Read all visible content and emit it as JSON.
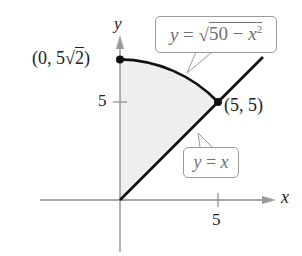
{
  "diagram": {
    "axes": {
      "x_label": "x",
      "y_label": "y",
      "x_ticks": [
        {
          "value": 5,
          "label": "5"
        }
      ],
      "y_ticks": [
        {
          "value": 5,
          "label": "5"
        }
      ]
    },
    "curves": [
      {
        "name": "circle-arc",
        "equation": "y = √(50 − x²)",
        "from": [
          0,
          7.071
        ],
        "to": [
          5,
          5
        ]
      },
      {
        "name": "line",
        "equation": "y = x",
        "from": [
          0,
          0
        ],
        "to": [
          7.2,
          7.2
        ]
      }
    ],
    "region": {
      "description": "shaded region between y = x and y = √(50 − x²) for 0 ≤ x ≤ 5",
      "fill": "#efefef"
    },
    "points": [
      {
        "coords": [
          0,
          7.071
        ],
        "label_main": "(0, 5",
        "label_radical": "√",
        "label_radicand": "2",
        "label_close": ")"
      },
      {
        "coords": [
          5,
          5
        ],
        "label": "(5, 5)"
      }
    ],
    "callouts": {
      "curve": {
        "lhs": "y",
        "eq": " = ",
        "radical": "√",
        "radicand_num": "50 − ",
        "radicand_var": "x",
        "exp": "2"
      },
      "line": {
        "lhs": "y",
        "eq": " = ",
        "rhs": "x"
      }
    },
    "colors": {
      "curve": "#111111",
      "axis": "#8a8a8a",
      "shade": "#efefef",
      "callout_border": "#9a9a9a",
      "callout_text": "#6f6f6f"
    }
  }
}
